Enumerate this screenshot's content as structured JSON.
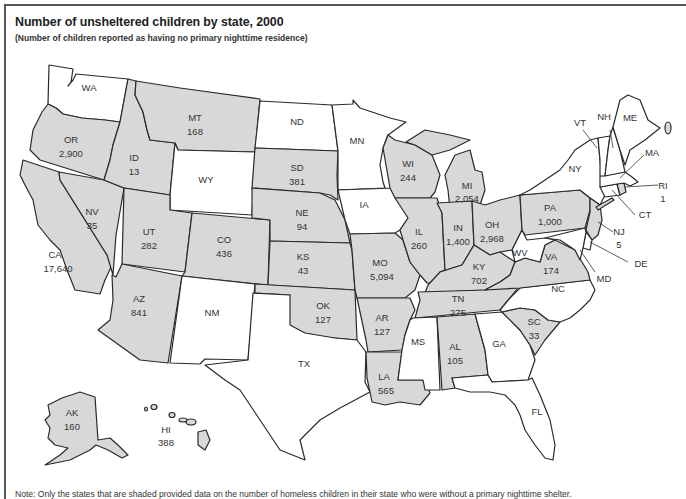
{
  "title": "Number of unsheltered children by state, 2000",
  "subtitle": "(Number of children reported as having no primary nighttime residence)",
  "note": "Note: Only the states that are shaded provided data on the number of homeless children in their state who were without a primary nighttime shelter.",
  "colors": {
    "shaded": "#d8d8d8",
    "unshaded": "#ffffff",
    "border": "#2a2a2a"
  },
  "states": {
    "WA": {
      "abbr": "WA",
      "value": null,
      "shaded": false
    },
    "OR": {
      "abbr": "OR",
      "value": "2,900",
      "shaded": true
    },
    "CA": {
      "abbr": "CA",
      "value": "17,640",
      "shaded": true
    },
    "NV": {
      "abbr": "NV",
      "value": "35",
      "shaded": true
    },
    "ID": {
      "abbr": "ID",
      "value": "13",
      "shaded": true
    },
    "MT": {
      "abbr": "MT",
      "value": "168",
      "shaded": true
    },
    "WY": {
      "abbr": "WY",
      "value": null,
      "shaded": false
    },
    "UT": {
      "abbr": "UT",
      "value": "282",
      "shaded": true
    },
    "AZ": {
      "abbr": "AZ",
      "value": "841",
      "shaded": true
    },
    "CO": {
      "abbr": "CO",
      "value": "436",
      "shaded": true
    },
    "NM": {
      "abbr": "NM",
      "value": null,
      "shaded": false
    },
    "ND": {
      "abbr": "ND",
      "value": null,
      "shaded": false
    },
    "SD": {
      "abbr": "SD",
      "value": "381",
      "shaded": true
    },
    "NE": {
      "abbr": "NE",
      "value": "94",
      "shaded": true
    },
    "KS": {
      "abbr": "KS",
      "value": "43",
      "shaded": true
    },
    "OK": {
      "abbr": "OK",
      "value": "127",
      "shaded": true
    },
    "TX": {
      "abbr": "TX",
      "value": null,
      "shaded": false
    },
    "MN": {
      "abbr": "MN",
      "value": null,
      "shaded": false
    },
    "IA": {
      "abbr": "IA",
      "value": null,
      "shaded": false
    },
    "MO": {
      "abbr": "MO",
      "value": "5,094",
      "shaded": true
    },
    "AR": {
      "abbr": "AR",
      "value": "127",
      "shaded": true
    },
    "LA": {
      "abbr": "LA",
      "value": "565",
      "shaded": true
    },
    "WI": {
      "abbr": "WI",
      "value": "244",
      "shaded": true
    },
    "IL": {
      "abbr": "IL",
      "value": "260",
      "shaded": true
    },
    "MI": {
      "abbr": "MI",
      "value": "2,054",
      "shaded": true
    },
    "IN": {
      "abbr": "IN",
      "value": "1,400",
      "shaded": true
    },
    "OH": {
      "abbr": "OH",
      "value": "2,968",
      "shaded": true
    },
    "KY": {
      "abbr": "KY",
      "value": "702",
      "shaded": true
    },
    "TN": {
      "abbr": "TN",
      "value": "275",
      "shaded": true
    },
    "MS": {
      "abbr": "MS",
      "value": null,
      "shaded": false
    },
    "AL": {
      "abbr": "AL",
      "value": "105",
      "shaded": true
    },
    "GA": {
      "abbr": "GA",
      "value": null,
      "shaded": false
    },
    "FL": {
      "abbr": "FL",
      "value": null,
      "shaded": false
    },
    "SC": {
      "abbr": "SC",
      "value": "33",
      "shaded": true
    },
    "NC": {
      "abbr": "NC",
      "value": null,
      "shaded": false
    },
    "VA": {
      "abbr": "VA",
      "value": "174",
      "shaded": true
    },
    "WV": {
      "abbr": "WV",
      "value": null,
      "shaded": false
    },
    "PA": {
      "abbr": "PA",
      "value": "1,000",
      "shaded": true
    },
    "NY": {
      "abbr": "NY",
      "value": null,
      "shaded": false
    },
    "NJ": {
      "abbr": "NJ",
      "value": "5",
      "shaded": true
    },
    "DE": {
      "abbr": "DE",
      "value": null,
      "shaded": false
    },
    "MD": {
      "abbr": "MD",
      "value": null,
      "shaded": false
    },
    "CT": {
      "abbr": "CT",
      "value": null,
      "shaded": false
    },
    "RI": {
      "abbr": "RI",
      "value": "1",
      "shaded": true
    },
    "MA": {
      "abbr": "MA",
      "value": null,
      "shaded": false
    },
    "VT": {
      "abbr": "VT",
      "value": null,
      "shaded": false
    },
    "NH": {
      "abbr": "NH",
      "value": null,
      "shaded": false
    },
    "ME": {
      "abbr": "ME",
      "value": null,
      "shaded": false
    },
    "AK": {
      "abbr": "AK",
      "value": "160",
      "shaded": true
    },
    "HI": {
      "abbr": "HI",
      "value": "388",
      "shaded": true
    }
  }
}
